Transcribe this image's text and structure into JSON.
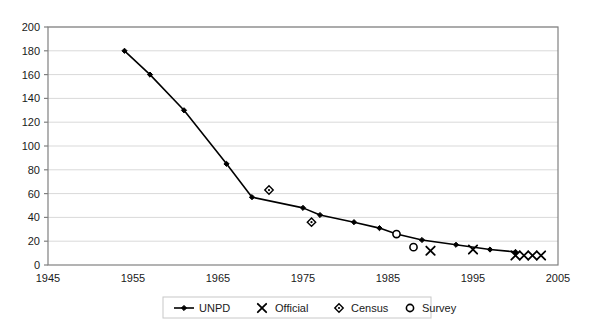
{
  "chart_data": {
    "type": "line",
    "title": "",
    "xlabel": "",
    "ylabel": "",
    "xlim": [
      1945,
      2005
    ],
    "ylim": [
      0,
      200
    ],
    "grid": true,
    "legend_position": "bottom",
    "xticks": [
      1945,
      1955,
      1965,
      1975,
      1985,
      1995,
      2005
    ],
    "yticks": [
      0,
      20,
      40,
      60,
      80,
      100,
      120,
      140,
      160,
      180,
      200
    ],
    "series": [
      {
        "name": "UNPD",
        "marker": "filled-diamond",
        "line": true,
        "points": [
          {
            "x": 1954,
            "y": 180
          },
          {
            "x": 1957,
            "y": 160
          },
          {
            "x": 1961,
            "y": 130
          },
          {
            "x": 1966,
            "y": 85
          },
          {
            "x": 1969,
            "y": 57
          },
          {
            "x": 1975,
            "y": 48
          },
          {
            "x": 1977,
            "y": 42
          },
          {
            "x": 1981,
            "y": 36
          },
          {
            "x": 1984,
            "y": 31
          },
          {
            "x": 1986,
            "y": 26
          },
          {
            "x": 1989,
            "y": 21
          },
          {
            "x": 1993,
            "y": 17
          },
          {
            "x": 1997,
            "y": 13
          },
          {
            "x": 2000,
            "y": 11
          }
        ]
      },
      {
        "name": "Official",
        "marker": "cross",
        "line": false,
        "points": [
          {
            "x": 1990,
            "y": 12
          },
          {
            "x": 1995,
            "y": 13
          },
          {
            "x": 2000,
            "y": 8
          },
          {
            "x": 2001,
            "y": 8
          },
          {
            "x": 2002,
            "y": 8
          },
          {
            "x": 2003,
            "y": 8
          }
        ]
      },
      {
        "name": "Census",
        "marker": "open-diamond",
        "line": false,
        "points": [
          {
            "x": 1971,
            "y": 63
          },
          {
            "x": 1976,
            "y": 36
          }
        ]
      },
      {
        "name": "Survey",
        "marker": "open-circle",
        "line": false,
        "points": [
          {
            "x": 1986,
            "y": 26
          },
          {
            "x": 1988,
            "y": 15
          }
        ]
      }
    ]
  },
  "legend": {
    "items": [
      {
        "label": "UNPD",
        "marker": "line-filled-diamond"
      },
      {
        "label": "Official",
        "marker": "cross"
      },
      {
        "label": "Census",
        "marker": "open-diamond"
      },
      {
        "label": "Survey",
        "marker": "open-circle"
      }
    ]
  },
  "colors": {
    "series_line": "#000000",
    "grid": "#d9d9d9",
    "axis": "#808080",
    "text": "#1a1a1a",
    "background": "#ffffff"
  }
}
